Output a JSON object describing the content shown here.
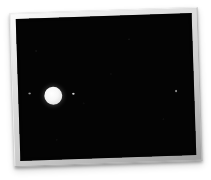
{
  "view": {
    "name": "photo-viewer",
    "background_color": "#ffffff",
    "caption": ""
  },
  "photo": {
    "frame": {
      "style": "white-mat-border",
      "mat_color": "#d8d8d8",
      "rotation_degrees": -1.9,
      "shadow": "drop",
      "left": 12,
      "top": 10,
      "width": 188,
      "height": 154
    },
    "image": {
      "alt": "Night sky astrophotograph of a bright planet with four small moons in a line",
      "background_color": "#040404",
      "subject": "planet-and-moons"
    }
  },
  "scene": {
    "type": "astrophotograph",
    "field_background": "#040404",
    "bodies": [
      {
        "id": "moon-outer-left",
        "label": "Callisto",
        "kind": "moon",
        "brightness": "faint",
        "x_pct": 6.5,
        "y_pct": 53.0,
        "diameter_px": 2.2,
        "color": "#e8e8e8"
      },
      {
        "id": "planet-jupiter",
        "label": "Jupiter",
        "kind": "planet",
        "brightness": "bright",
        "x_pct": 20.0,
        "y_pct": 55.0,
        "diameter_px": 18,
        "color": "#ffffff"
      },
      {
        "id": "moon-inner-right",
        "label": "Europa",
        "kind": "moon",
        "brightness": "medium",
        "x_pct": 31.5,
        "y_pct": 54.0,
        "diameter_px": 2.6,
        "color": "#e0e0e0"
      },
      {
        "id": "moon-outer-right",
        "label": "Ganymede",
        "kind": "moon",
        "brightness": "faint",
        "x_pct": 89.5,
        "y_pct": 54.5,
        "diameter_px": 2.2,
        "color": "#dcdcdc"
      }
    ]
  }
}
